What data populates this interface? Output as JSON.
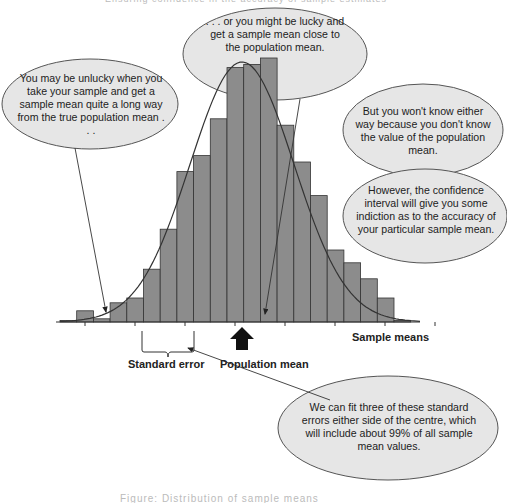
{
  "page": {
    "header_title": "Ensuring confidence in the accuracy of sample estimates",
    "caption": "Figure: Distribution of sample means"
  },
  "bubbles": {
    "unlucky": "You may be unlucky when you take your sample and get a sample mean quite a long way from the true population mean . . .",
    "lucky": ". . . or you might be lucky and get a sample mean close to the population mean.",
    "wont_know": "But you won't know either way because you don't know the value of the population mean.",
    "confidence": "However, the confidence interval will give you some indiction as to the accuracy of your particular sample mean.",
    "three_se": "We can fit three of these standard errors either side of the centre, which will include about 99% of all sample mean values."
  },
  "labels": {
    "sample_means": "Sample means",
    "standard_error": "Standard error",
    "population_mean": "Population mean"
  },
  "colors": {
    "bar_fill": "#8c8c8c",
    "bar_stroke": "#333333",
    "bubble_fill": "#e6e6e6",
    "bubble_stroke": "#555555",
    "curve": "#333333",
    "arrow": "#222222"
  },
  "chart_data": {
    "type": "bar",
    "xlabel": "Sample means",
    "ylabel": "",
    "categories": [
      "b1",
      "b2",
      "b3",
      "b4",
      "b5",
      "b6",
      "b7",
      "b8",
      "b9",
      "b10",
      "b11",
      "b12",
      "b13",
      "b14",
      "b15",
      "b16",
      "b17",
      "b18",
      "b19",
      "b20",
      "b21"
    ],
    "values": [
      1,
      7,
      2,
      12,
      15,
      33,
      58,
      94,
      104,
      127,
      159,
      161,
      165,
      123,
      100,
      79,
      45,
      37,
      27,
      15,
      1
    ],
    "overlay": "normal curve",
    "annotations": [
      "Standard error",
      "Population mean",
      "Sample means"
    ]
  }
}
